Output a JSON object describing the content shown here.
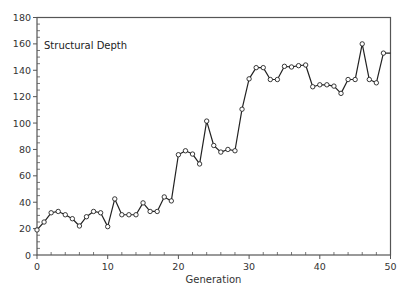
{
  "chart_data": {
    "type": "line",
    "title": "Structural Depth",
    "xlabel": "Generation",
    "ylabel": "",
    "xlim": [
      0,
      50
    ],
    "ylim": [
      0,
      180
    ],
    "xticks": [
      0,
      10,
      20,
      30,
      40,
      50
    ],
    "yticks": [
      0,
      20,
      40,
      60,
      80,
      100,
      120,
      140,
      160,
      180
    ],
    "x_minor_step": 2,
    "y_minor_step": 5,
    "grid": false,
    "legend": null,
    "markers": "open-circle",
    "series": [
      {
        "name": "Structural Depth",
        "x": [
          0,
          1,
          2,
          3,
          4,
          5,
          6,
          7,
          8,
          9,
          10,
          11,
          12,
          13,
          14,
          15,
          16,
          17,
          18,
          19,
          20,
          21,
          22,
          23,
          24,
          25,
          26,
          27,
          28,
          29,
          30,
          31,
          32,
          33,
          34,
          35,
          36,
          37,
          38,
          39,
          40,
          41,
          42,
          43,
          44,
          45,
          46,
          47,
          48,
          49,
          50
        ],
        "values": [
          19,
          25,
          32,
          33,
          30.5,
          27.5,
          22,
          29,
          33,
          32,
          21.5,
          42.5,
          30.5,
          30.5,
          30.5,
          39.5,
          33,
          33,
          44,
          41,
          76,
          79,
          76.5,
          69,
          101.5,
          83,
          78,
          80,
          79,
          110.5,
          133.5,
          142,
          142,
          133,
          133,
          143,
          142.5,
          143.5,
          144,
          127.5,
          129,
          129,
          128,
          122.5,
          133,
          133,
          160,
          133,
          130.5,
          153,
          153
        ]
      }
    ]
  },
  "colors": {
    "line": "#222222",
    "marker_fill": "#ffffff",
    "axis": "#555555",
    "background": "#ffffff"
  }
}
